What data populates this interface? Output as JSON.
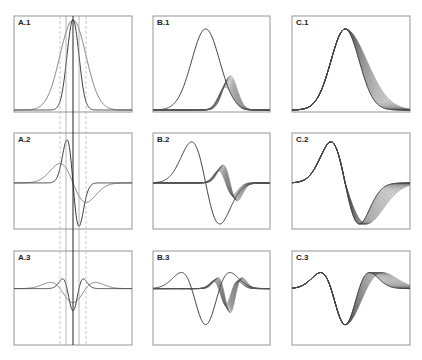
{
  "figure": {
    "colors": {
      "background": "#ffffff",
      "frame": "#8a8a8a",
      "curve": "#3a3a3a",
      "family": "#555555",
      "guide_solid": "#222222",
      "guide_gray": "#9a9a9a",
      "guide_dashed": "#b0b0b0"
    },
    "columns": [
      {
        "id": "A",
        "x0": 14,
        "x1": 132
      },
      {
        "id": "B",
        "x0": 153,
        "x1": 270
      },
      {
        "id": "C",
        "x0": 292,
        "x1": 410
      }
    ],
    "rows": [
      {
        "id": "1",
        "y0": 16,
        "y1": 112,
        "order": 0
      },
      {
        "id": "2",
        "y0": 133,
        "y1": 229,
        "order": 1
      },
      {
        "id": "3",
        "y0": 251,
        "y1": 345,
        "order": 2
      }
    ],
    "panels": [
      {
        "label": "A.1",
        "col": 0,
        "row": 0
      },
      {
        "label": "B.1",
        "col": 1,
        "row": 0
      },
      {
        "label": "C.1",
        "col": 2,
        "row": 0
      },
      {
        "label": "A.2",
        "col": 0,
        "row": 1
      },
      {
        "label": "B.2",
        "col": 1,
        "row": 1
      },
      {
        "label": "C.2",
        "col": 2,
        "row": 1
      },
      {
        "label": "A.3",
        "col": 0,
        "row": 2
      },
      {
        "label": "B.3",
        "col": 1,
        "row": 2
      },
      {
        "label": "C.3",
        "col": 2,
        "row": 2
      }
    ],
    "guide_lines": {
      "y_top": 16,
      "y_bottom": 345,
      "lines": [
        {
          "x": 60,
          "style": "dashed"
        },
        {
          "x": 66,
          "style": "gray"
        },
        {
          "x": 73,
          "style": "solid"
        },
        {
          "x": 79,
          "style": "gray"
        },
        {
          "x": 86,
          "style": "dashed"
        }
      ]
    },
    "column_A": {
      "center": 73,
      "sigmas": [
        6,
        13
      ],
      "description": "Two Gaussian widths (narrow and wide) with derivatives; narrow one drawn darker"
    },
    "column_B": {
      "main": {
        "center": 0.45,
        "sigma": 0.12
      },
      "family": {
        "center_start": 0.62,
        "center_end": 0.66,
        "sigma": 0.06,
        "amp_start": 0.25,
        "amp_end": 0.38,
        "count": 14
      },
      "description": "Large reference curve plus a family of small shifted/scaled curves"
    },
    "column_C": {
      "main": {
        "center": 0.45,
        "sigma": 0.12
      },
      "family": {
        "sigma_start": 0.12,
        "sigma_end": 0.16,
        "shift_end": 0.04,
        "count": 14
      },
      "description": "Reference curve plus a family with progressively widened right flank"
    }
  }
}
